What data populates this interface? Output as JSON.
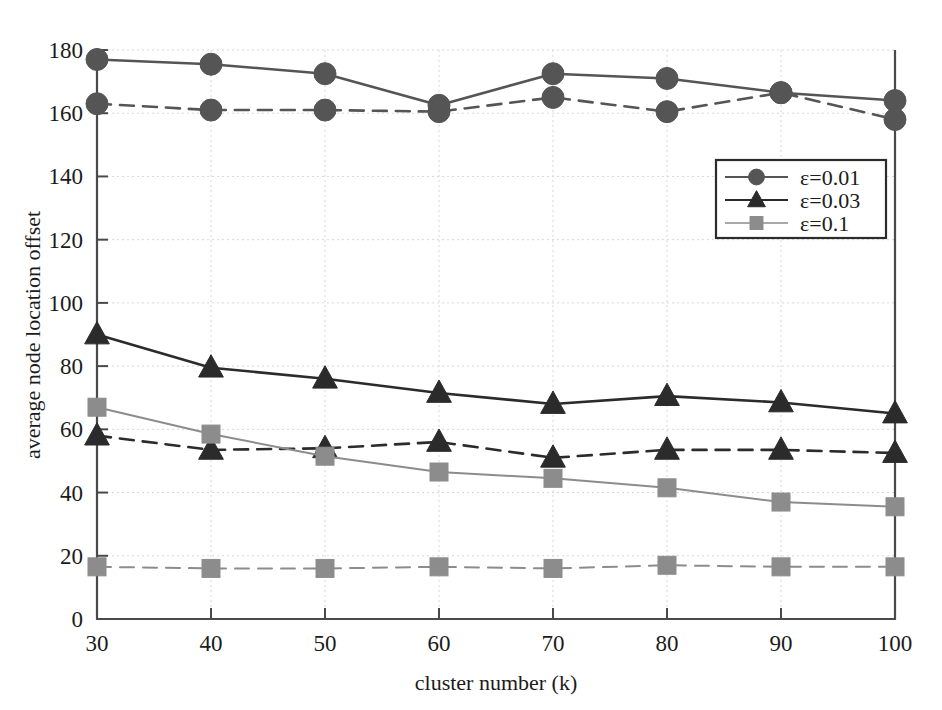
{
  "figure": {
    "background_color": "#ffffff",
    "frame_color": "#4a4a4a"
  },
  "axes": {
    "x": {
      "title": "cluster number (k)",
      "ticks": [
        "30",
        "40",
        "50",
        "60",
        "70",
        "80",
        "90",
        "100"
      ],
      "range": [
        30,
        100
      ]
    },
    "y": {
      "title": "average node location offset",
      "ticks": [
        "0",
        "20",
        "40",
        "60",
        "80",
        "100",
        "120",
        "140",
        "160",
        "180"
      ],
      "range": [
        0,
        180
      ]
    }
  },
  "legend": {
    "position": "upper-right",
    "entries": [
      {
        "label": "ε=0.01",
        "marker": "circle",
        "color": "#555555"
      },
      {
        "label": "ε=0.03",
        "marker": "triangle",
        "color": "#2b2b2b"
      },
      {
        "label": "ε=0.1",
        "marker": "square",
        "color": "#8c8c8c"
      }
    ]
  },
  "chart_data": {
    "type": "line",
    "title": "",
    "xlabel": "cluster number (k)",
    "ylabel": "average node location offset",
    "xlim": [
      30,
      100
    ],
    "ylim": [
      0,
      180
    ],
    "grid": true,
    "legend_position": "upper-right",
    "x": [
      30,
      40,
      50,
      60,
      70,
      80,
      90,
      100
    ],
    "series": [
      {
        "name": "ε=0.01",
        "marker": "circle",
        "linestyle": "solid",
        "color": "#555555",
        "values": [
          177,
          175.5,
          172.5,
          162.5,
          172.5,
          171,
          166.5,
          164
        ]
      },
      {
        "name": "ε=0.01",
        "marker": "circle",
        "linestyle": "dashed",
        "color": "#555555",
        "values": [
          163,
          161,
          161,
          160.5,
          165,
          160.5,
          166.5,
          158
        ]
      },
      {
        "name": "ε=0.03",
        "marker": "triangle",
        "linestyle": "solid",
        "color": "#2b2b2b",
        "values": [
          90,
          79.5,
          76,
          71.5,
          68,
          70.5,
          68.5,
          65
        ]
      },
      {
        "name": "ε=0.03",
        "marker": "triangle",
        "linestyle": "dashed",
        "color": "#2b2b2b",
        "values": [
          58,
          53.5,
          54,
          56,
          51,
          53.5,
          53.5,
          52.5
        ]
      },
      {
        "name": "ε=0.1",
        "marker": "square",
        "linestyle": "solid",
        "color": "#8c8c8c",
        "values": [
          67,
          58.5,
          51.5,
          46.5,
          44.5,
          41.5,
          37,
          35.5
        ]
      },
      {
        "name": "ε=0.1",
        "marker": "square",
        "linestyle": "dashed",
        "color": "#8c8c8c",
        "values": [
          16.5,
          16,
          16,
          16.5,
          16,
          17,
          16.5,
          16.5
        ]
      }
    ]
  }
}
